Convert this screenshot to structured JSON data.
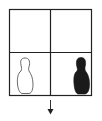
{
  "diagram": {
    "type": "2x2 grid with figures",
    "grid": {
      "rows": 2,
      "cols": 2
    },
    "cells": [
      {
        "row": 0,
        "col": 0,
        "content": "empty"
      },
      {
        "row": 0,
        "col": 1,
        "content": "empty"
      },
      {
        "row": 1,
        "col": 0,
        "content": "outlined figure"
      },
      {
        "row": 1,
        "col": 1,
        "content": "filled black figure"
      }
    ],
    "arrow": {
      "direction": "down"
    },
    "colors": {
      "stroke": "#222222",
      "fill": "#1a1a1a",
      "background": "#ffffff"
    }
  }
}
